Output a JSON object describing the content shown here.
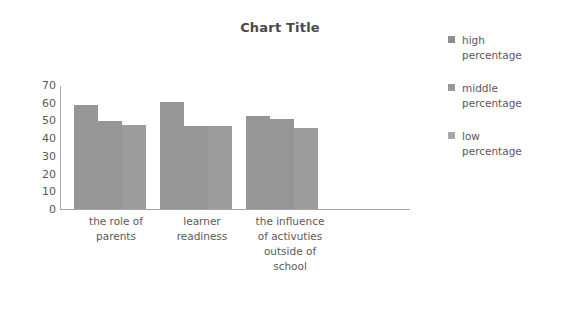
{
  "chart_data": {
    "type": "bar",
    "title": "Chart Title",
    "xlabel": "",
    "ylabel": "",
    "ylim": [
      0,
      70
    ],
    "yticks": [
      70,
      60,
      50,
      40,
      30,
      20,
      10,
      0
    ],
    "grid": false,
    "legend_position": "right",
    "categories": [
      "the role of parents",
      "learner readiness",
      "the influence of activuties outside of school"
    ],
    "series": [
      {
        "name": "high percentage",
        "values": [
          59,
          61,
          53
        ],
        "color": "#969696"
      },
      {
        "name": "middle percentage",
        "values": [
          50,
          47,
          51
        ],
        "color": "#969696"
      },
      {
        "name": "low percentage",
        "values": [
          48,
          47,
          46
        ],
        "color": "#9c9c9c"
      }
    ]
  },
  "legend": {
    "items": [
      {
        "label_line1": "high",
        "label_line2": "percentage",
        "swatch_color": "#8f8f8f"
      },
      {
        "label_line1": "middle",
        "label_line2": "percentage",
        "swatch_color": "#9a9a9a"
      },
      {
        "label_line1": "low",
        "label_line2": "percentage",
        "swatch_color": "#a8a8a8"
      }
    ]
  },
  "category_labels": [
    {
      "lines": [
        "the role of",
        "parents"
      ]
    },
    {
      "lines": [
        "learner",
        "readiness"
      ]
    },
    {
      "lines": [
        "the influence",
        "of activuties",
        "outside of",
        "school"
      ]
    }
  ]
}
